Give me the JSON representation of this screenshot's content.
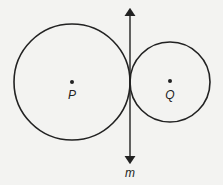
{
  "diagram": {
    "line": {
      "label": "m"
    },
    "circles": [
      {
        "center_label": "P",
        "cx": 72,
        "cy": 82,
        "r": 58
      },
      {
        "center_label": "Q",
        "cx": 170,
        "cy": 82,
        "r": 40
      }
    ],
    "colors": {
      "stroke": "#222222",
      "background": "#f3f3f1"
    }
  }
}
